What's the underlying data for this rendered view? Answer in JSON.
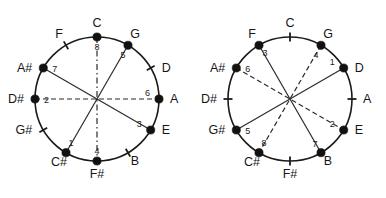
{
  "figure": {
    "background": "#ffffff",
    "ink": "#1a1a1a"
  },
  "note_order": [
    "C",
    "G",
    "D",
    "A",
    "E",
    "B",
    "F#",
    "C#",
    "G#",
    "D#",
    "A#",
    "F"
  ],
  "diagrams": [
    {
      "id": "left",
      "name": "chromatic-circle-left",
      "center": {
        "x": 97,
        "y": 99
      },
      "radius": 62,
      "positions": [
        {
          "note": "C",
          "angle_deg": 0,
          "marker": "dot",
          "index": "8",
          "label_side": "top"
        },
        {
          "note": "G",
          "angle_deg": 30,
          "marker": "dot",
          "index": "5",
          "label_side": "top-right"
        },
        {
          "note": "D",
          "angle_deg": 60,
          "marker": "tick",
          "index": "",
          "label_side": "right"
        },
        {
          "note": "A",
          "angle_deg": 90,
          "marker": "dot",
          "index": "6",
          "label_side": "right"
        },
        {
          "note": "E",
          "angle_deg": 120,
          "marker": "dot",
          "index": "3",
          "label_side": "right"
        },
        {
          "note": "B",
          "angle_deg": 150,
          "marker": "tick",
          "index": "",
          "label_side": "bottom-right"
        },
        {
          "note": "F#",
          "angle_deg": 180,
          "marker": "dot",
          "index": "4",
          "label_side": "bottom"
        },
        {
          "note": "C#",
          "angle_deg": 210,
          "marker": "dot",
          "index": "1",
          "label_side": "bottom-left"
        },
        {
          "note": "G#",
          "angle_deg": 240,
          "marker": "tick",
          "index": "",
          "label_side": "left"
        },
        {
          "note": "D#",
          "angle_deg": 270,
          "marker": "dot",
          "index": "2",
          "label_side": "left"
        },
        {
          "note": "A#",
          "angle_deg": 300,
          "marker": "dot",
          "index": "7",
          "label_side": "left"
        },
        {
          "note": "F",
          "angle_deg": 330,
          "marker": "tick",
          "index": "",
          "label_side": "top-left"
        }
      ],
      "chords": [
        {
          "from": "C",
          "to": "F#",
          "style": "dashdot"
        },
        {
          "from": "D#",
          "to": "A",
          "style": "dashed"
        },
        {
          "from": "A#",
          "to": "E",
          "style": "solid"
        },
        {
          "from": "G",
          "to": "C#",
          "style": "solid"
        }
      ]
    },
    {
      "id": "right",
      "name": "chromatic-circle-right",
      "center": {
        "x": 97,
        "y": 99
      },
      "radius": 62,
      "positions": [
        {
          "note": "C",
          "angle_deg": 0,
          "marker": "tick",
          "index": "",
          "label_side": "top"
        },
        {
          "note": "G",
          "angle_deg": 30,
          "marker": "dot",
          "index": "4",
          "label_side": "top-right"
        },
        {
          "note": "D",
          "angle_deg": 60,
          "marker": "dot",
          "index": "1",
          "label_side": "right"
        },
        {
          "note": "A",
          "angle_deg": 90,
          "marker": "tick",
          "index": "",
          "label_side": "right"
        },
        {
          "note": "E",
          "angle_deg": 120,
          "marker": "dot",
          "index": "2",
          "label_side": "right"
        },
        {
          "note": "B",
          "angle_deg": 150,
          "marker": "dot",
          "index": "7",
          "label_side": "bottom-right"
        },
        {
          "note": "F#",
          "angle_deg": 180,
          "marker": "tick",
          "index": "",
          "label_side": "bottom"
        },
        {
          "note": "C#",
          "angle_deg": 210,
          "marker": "dot",
          "index": "8",
          "label_side": "bottom-left"
        },
        {
          "note": "G#",
          "angle_deg": 240,
          "marker": "dot",
          "index": "5",
          "label_side": "left"
        },
        {
          "note": "D#",
          "angle_deg": 270,
          "marker": "tick",
          "index": "",
          "label_side": "left"
        },
        {
          "note": "A#",
          "angle_deg": 300,
          "marker": "dot",
          "index": "6",
          "label_side": "left"
        },
        {
          "note": "F",
          "angle_deg": 330,
          "marker": "dot",
          "index": "3",
          "label_side": "top-left"
        }
      ],
      "chords": [
        {
          "from": "F",
          "to": "B",
          "style": "solid"
        },
        {
          "from": "G",
          "to": "C#",
          "style": "dashed"
        },
        {
          "from": "D",
          "to": "G#",
          "style": "solid"
        },
        {
          "from": "A#",
          "to": "E",
          "style": "dashed"
        }
      ]
    }
  ]
}
